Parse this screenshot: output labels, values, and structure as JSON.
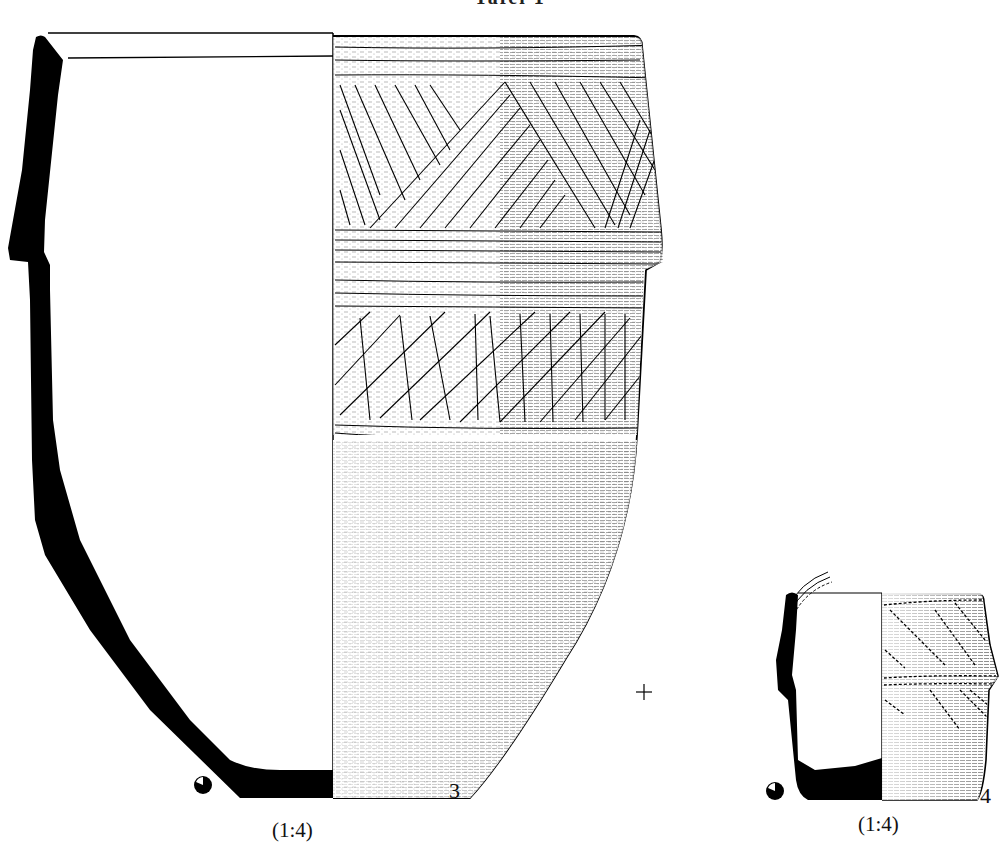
{
  "plate": {
    "title": "Tafel 1"
  },
  "vessels": [
    {
      "number": "3",
      "scale": "(1:4)",
      "description": "Large biconical pot, section profile on left, incised decoration on right"
    },
    {
      "number": "4",
      "scale": "(1:4)",
      "description": "Small biconical pot, section profile on left, incised decoration on right"
    }
  ],
  "marks": {
    "registration_cross": "+",
    "orientation_symbol": "half-filled-circle"
  },
  "colors": {
    "ink": "#000000",
    "paper": "#ffffff"
  }
}
